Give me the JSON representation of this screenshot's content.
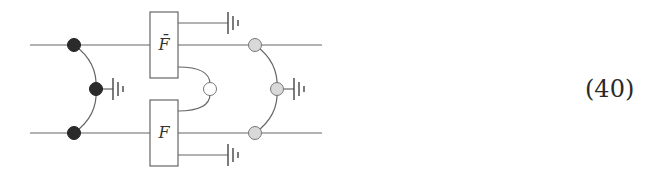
{
  "equation": {
    "number": "(40)"
  },
  "diagram": {
    "type": "circuit-tensor-network",
    "colors": {
      "wire": "#666666",
      "node_dark": "#2b2b2b",
      "node_light": "#d9d9d9",
      "node_white": "#ffffff",
      "box_fill": "#ffffff"
    },
    "wires": {
      "top_y": 45,
      "bottom_y": 133,
      "x_start": 30,
      "x_end": 322
    },
    "boxes": [
      {
        "id": "top",
        "label": "F̄",
        "x": 150,
        "y": 12,
        "w": 28,
        "h": 66
      },
      {
        "id": "bottom",
        "label": "F",
        "x": 150,
        "y": 100,
        "w": 28,
        "h": 66
      }
    ],
    "node_groups": [
      {
        "id": "left",
        "color": "dark",
        "nodes": [
          {
            "x": 74,
            "y": 45
          },
          {
            "x": 96,
            "y": 89
          },
          {
            "x": 74,
            "y": 133
          }
        ],
        "grounded_middle": true
      },
      {
        "id": "right",
        "color": "light",
        "nodes": [
          {
            "x": 255,
            "y": 45
          },
          {
            "x": 277,
            "y": 89
          },
          {
            "x": 255,
            "y": 133
          }
        ],
        "grounded_middle": true
      }
    ],
    "center_node": {
      "color": "white",
      "x": 210,
      "y": 89
    },
    "grounds": [
      {
        "id": "top-box-ground",
        "from_x": 178,
        "y": 23,
        "to_x": 228
      },
      {
        "id": "bottom-box-ground",
        "from_x": 178,
        "y": 155,
        "to_x": 228
      },
      {
        "id": "left-node-ground",
        "from_x": 96,
        "y": 89,
        "to_x": 113
      },
      {
        "id": "right-node-ground",
        "from_x": 277,
        "y": 89,
        "to_x": 294
      }
    ]
  }
}
